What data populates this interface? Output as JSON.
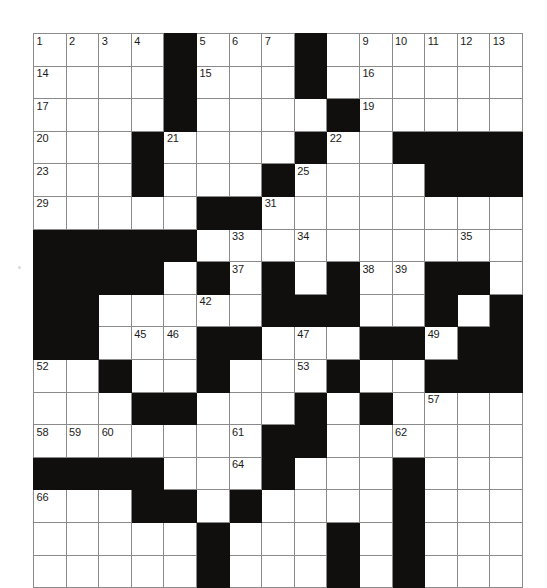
{
  "page": {
    "background_color": "#ffffff",
    "block_color": "#100f0d",
    "grid_line_color": "#8a8a8a",
    "number_color": "#1a1a1a"
  },
  "grid": {
    "columns": 15,
    "rows": 17,
    "cell_size_px": 32.6,
    "origin_x_px": 33,
    "origin_y_px": 33,
    "legend": {
      "block": "#",
      "open": "."
    },
    "pattern": [
      "....#...#......",
      "....#...#......",
      "....#....#.....",
      "...#....#..####",
      "...#...#....###",
      ".....##........",
      "#####..........",
      "####.#.#.#..##.",
      "##.....###..#.#",
      "##...##...##.##",
      "..#..#...#..###",
      "...##...#.#....",
      ".......##......",
      "####...#...#...",
      "...##.#....#...",
      ".....#...#.#...",
      ".....#...#.#..."
    ],
    "numbers": {
      "0": {
        "0": "1",
        "1": "2",
        "2": "3",
        "3": "4",
        "5": "5",
        "6": "6",
        "7": "7",
        "8": "8",
        "10": "9",
        "11": "10",
        "12": "11",
        "13": "12",
        "14": "13"
      },
      "1": {
        "0": "14",
        "5": "15",
        "10": "16"
      },
      "2": {
        "0": "17",
        "4": "18",
        "10": "19"
      },
      "3": {
        "0": "20",
        "4": "21",
        "9": "22"
      },
      "4": {
        "0": "23",
        "3": "24",
        "8": "25",
        "12": "26",
        "13": "27",
        "14": "28"
      },
      "5": {
        "0": "29",
        "6": "30",
        "7": "31"
      },
      "6": {
        "4": "32",
        "6": "33",
        "8": "34",
        "13": "35"
      },
      "7": {
        "2": "36",
        "6": "37",
        "10": "38",
        "11": "39"
      },
      "8": {
        "0": "40",
        "1": "41",
        "5": "42",
        "9": "43"
      },
      "9": {
        "0": "44",
        "3": "45",
        "4": "46",
        "8": "47",
        "10": "48",
        "12": "49",
        "13": "50",
        "14": "51"
      },
      "10": {
        "0": "52",
        "8": "53",
        "9": "54"
      },
      "11": {
        "4": "55",
        "8": "56",
        "12": "57"
      },
      "12": {
        "0": "58",
        "1": "59",
        "2": "60",
        "6": "61",
        "11": "62"
      },
      "13": {
        "0": "63",
        "6": "64",
        "11": "65"
      },
      "14": {
        "0": "66",
        "6": "67",
        "11": "68"
      }
    },
    "clue_numbers_list": [
      "1",
      "2",
      "3",
      "4",
      "5",
      "6",
      "7",
      "8",
      "9",
      "10",
      "11",
      "12",
      "13",
      "14",
      "15",
      "16",
      "17",
      "18",
      "19",
      "20",
      "21",
      "22",
      "23",
      "24",
      "25",
      "26",
      "27",
      "28",
      "29",
      "30",
      "31",
      "32",
      "33",
      "34",
      "35",
      "36",
      "37",
      "38",
      "39",
      "40",
      "41",
      "42",
      "43",
      "44",
      "45",
      "46",
      "47",
      "48",
      "49",
      "50",
      "51",
      "52",
      "53",
      "54",
      "55",
      "56",
      "57",
      "58",
      "59",
      "60",
      "61",
      "62",
      "63",
      "64",
      "65",
      "66",
      "67",
      "68"
    ],
    "highest_number": "68"
  }
}
